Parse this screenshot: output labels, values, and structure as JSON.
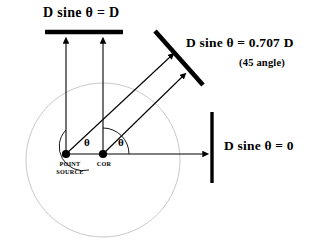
{
  "diagram": {
    "title_semantic": "point-source-detector-angle-diagram",
    "colors": {
      "stroke": "#000000",
      "circle": "#c9c9c9",
      "background": "#ffffff"
    },
    "labels": {
      "top_detector": "D sine θ = D",
      "diagonal_detector": "D sine θ =  0.707 D",
      "diagonal_detector_sub": "(45  angle)",
      "right_detector": "D sine θ = 0",
      "point_source": "POINT\nSOURCE",
      "cor": "COR",
      "theta_left": "θ",
      "theta_right": "θ"
    },
    "geometry": {
      "circle": {
        "cx": 103,
        "cy": 160,
        "r": 77
      },
      "point_source": {
        "x": 66,
        "y": 154
      },
      "cor": {
        "x": 103,
        "y": 154
      },
      "top_detector_bar": {
        "x1": 45,
        "y1": 32,
        "x2": 123,
        "y2": 32
      },
      "diagonal_detector_bar": {
        "x1": 155,
        "y1": 32,
        "x2": 202,
        "y2": 84
      },
      "right_detector_bar": {
        "x1": 212,
        "y1": 112,
        "x2": 212,
        "y2": 183
      },
      "rays": [
        {
          "name": "ray-point-source-up",
          "x1": 66,
          "y1": 154,
          "x2": 66,
          "y2": 40
        },
        {
          "name": "ray-cor-up",
          "x1": 103,
          "y1": 154,
          "x2": 103,
          "y2": 40
        },
        {
          "name": "ray-point-source-diagonal",
          "x1": 66,
          "y1": 154,
          "x2": 174,
          "y2": 53
        },
        {
          "name": "ray-cor-diagonal",
          "x1": 103,
          "y1": 154,
          "x2": 186,
          "y2": 73
        },
        {
          "name": "ray-cor-horizontal",
          "x1": 103,
          "y1": 154,
          "x2": 205,
          "y2": 154
        }
      ]
    }
  }
}
